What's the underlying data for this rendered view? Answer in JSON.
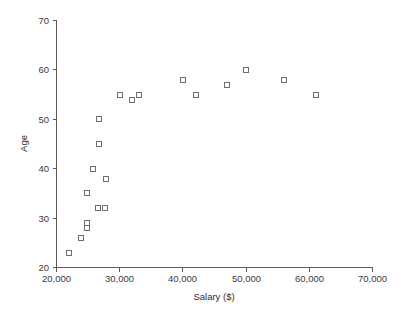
{
  "chart_data": {
    "type": "scatter",
    "title": "",
    "xlabel": "Salary ($)",
    "ylabel": "Age",
    "xlim": [
      20000,
      70000
    ],
    "ylim": [
      20,
      70
    ],
    "xticks": [
      20000,
      30000,
      40000,
      50000,
      60000,
      70000
    ],
    "xticklabels": [
      "20,000",
      "30,000",
      "40,000",
      "50,000",
      "60,000",
      "70,000"
    ],
    "yticks": [
      20,
      30,
      40,
      50,
      60,
      70
    ],
    "yticklabels": [
      "20",
      "30",
      "40",
      "50",
      "60",
      "70"
    ],
    "grid": false,
    "legend": null,
    "marker": "open-square",
    "marker_color": "#6e6e6e",
    "axis_color": "#5a5a5a",
    "points": [
      {
        "salary": 22000,
        "age": 23
      },
      {
        "salary": 23800,
        "age": 26
      },
      {
        "salary": 24800,
        "age": 28
      },
      {
        "salary": 24900,
        "age": 29
      },
      {
        "salary": 24900,
        "age": 35
      },
      {
        "salary": 25700,
        "age": 40
      },
      {
        "salary": 26600,
        "age": 32
      },
      {
        "salary": 26800,
        "age": 45
      },
      {
        "salary": 26800,
        "age": 50
      },
      {
        "salary": 27600,
        "age": 32
      },
      {
        "salary": 27900,
        "age": 38
      },
      {
        "salary": 30000,
        "age": 55
      },
      {
        "salary": 32000,
        "age": 54
      },
      {
        "salary": 33000,
        "age": 55
      },
      {
        "salary": 40000,
        "age": 58
      },
      {
        "salary": 42000,
        "age": 55
      },
      {
        "salary": 47000,
        "age": 57
      },
      {
        "salary": 50000,
        "age": 60
      },
      {
        "salary": 56000,
        "age": 58
      },
      {
        "salary": 61000,
        "age": 55
      }
    ]
  },
  "plot_geometry": {
    "left": 56,
    "right": 372,
    "top": 20,
    "bottom": 267
  },
  "colors": {
    "background": "#ffffff",
    "axis": "#5a5a5a",
    "text": "#3a3a3a",
    "marker_stroke": "#6e6e6e"
  }
}
